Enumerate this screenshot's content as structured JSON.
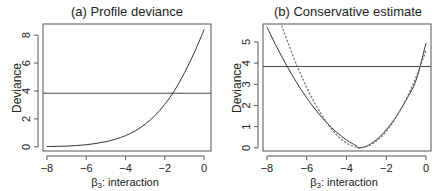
{
  "chart_data": [
    {
      "type": "line",
      "title": "(a) Profile deviance",
      "xlabel_symbol": "β",
      "xlabel_subscript": "3",
      "xlabel_rest": ": interaction",
      "ylabel": "Deviance",
      "xlim": [
        -8.2,
        0.35
      ],
      "ylim": [
        -0.3,
        8.8
      ],
      "xticks": [
        -8,
        -6,
        -4,
        -2,
        0
      ],
      "xtick_labels": [
        "−8",
        "−6",
        "−4",
        "−2",
        "0"
      ],
      "yticks": [
        0,
        2,
        4,
        6,
        8
      ],
      "ytick_labels": [
        "0",
        "2",
        "4",
        "6",
        "8"
      ],
      "hline": 3.84,
      "series": [
        {
          "name": "profile deviance",
          "style": "solid",
          "x": [
            -8,
            -7.5,
            -7,
            -6.5,
            -6,
            -5.5,
            -5,
            -4.5,
            -4,
            -3.5,
            -3,
            -2.5,
            -2,
            -1.5,
            -1,
            -0.5,
            0
          ],
          "y": [
            0.02,
            0.03,
            0.05,
            0.09,
            0.15,
            0.24,
            0.37,
            0.55,
            0.8,
            1.15,
            1.62,
            2.25,
            3.05,
            4.05,
            5.3,
            6.75,
            8.4
          ]
        }
      ]
    },
    {
      "type": "line",
      "title": "(b) Conservative estimate",
      "xlabel_symbol": "β",
      "xlabel_subscript": "3",
      "xlabel_rest": ": interaction",
      "ylabel": "Deviance",
      "xlim": [
        -8.2,
        0.25
      ],
      "ylim": [
        -0.15,
        5.85
      ],
      "xticks": [
        -8,
        -6,
        -4,
        -2,
        0
      ],
      "xtick_labels": [
        "−8",
        "−6",
        "−4",
        "−2",
        "0"
      ],
      "yticks": [
        0,
        1,
        2,
        3,
        4,
        5
      ],
      "ytick_labels": [
        "0",
        "1",
        "2",
        "3",
        "4",
        "5"
      ],
      "hline": 3.84,
      "series": [
        {
          "name": "conservative quadratic",
          "style": "solid",
          "x": [
            -8,
            -7.5,
            -7,
            -6.5,
            -6,
            -5.5,
            -5,
            -4.5,
            -4,
            -3.5,
            -3.4,
            -3,
            -2.5,
            -2,
            -1.5,
            -1,
            -0.5,
            0
          ],
          "y": [
            5.7,
            4.75,
            3.87,
            3.07,
            2.36,
            1.73,
            1.19,
            0.74,
            0.37,
            0.09,
            0.0,
            0.07,
            0.38,
            0.85,
            1.48,
            2.26,
            3.2,
            4.95
          ]
        },
        {
          "name": "quadratic approximation",
          "style": "dotted",
          "x": [
            -7.25,
            -7,
            -6.5,
            -6,
            -5.5,
            -5,
            -4.5,
            -4,
            -3.5,
            -3.4,
            -3,
            -2.5,
            -2,
            -1.5,
            -1,
            -0.5,
            0
          ],
          "y": [
            5.75,
            5.1,
            3.9,
            2.85,
            1.95,
            1.2,
            0.62,
            0.22,
            0.02,
            0.0,
            0.06,
            0.32,
            0.78,
            1.45,
            2.3,
            3.35,
            4.6
          ]
        }
      ]
    }
  ]
}
